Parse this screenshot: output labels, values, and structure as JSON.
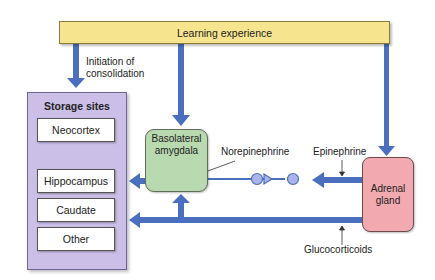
{
  "diagram": {
    "banner": {
      "label": "Learning experience",
      "color": "#f6e58e"
    },
    "consolidation_label_line1": "Initiation of",
    "consolidation_label_line2": "consolidation",
    "storage": {
      "title": "Storage sites",
      "color": "#cbbfe8",
      "sites": [
        {
          "label": "Neocortex"
        },
        {
          "label": "Hippocampus"
        },
        {
          "label": "Caudate"
        },
        {
          "label": "Other"
        }
      ]
    },
    "amygdala": {
      "line1": "Basolateral",
      "line2": "amygdala",
      "color": "#b9d9b0"
    },
    "adrenal": {
      "line1": "Adrenal",
      "line2": "gland",
      "color": "#f2aab0"
    },
    "labels": {
      "norepinephrine": "Norepinephrine",
      "epinephrine": "Epinephrine",
      "glucocorticoids": "Glucocorticoids"
    },
    "arrow_color": "#4a6fbf",
    "neuron_color": "#aab4ea"
  }
}
